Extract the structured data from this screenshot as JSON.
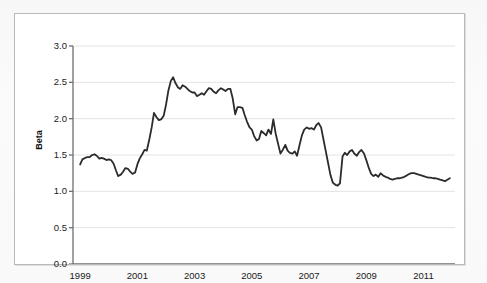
{
  "figure": {
    "background_color": "#ffffff",
    "frame_color": "#b9b9b9",
    "page_background": "#f8f8f8"
  },
  "chart_data": {
    "type": "line",
    "title": "",
    "subtitle": "",
    "xlabel": "",
    "ylabel": "Beta",
    "xlim": [
      1998.75,
      2012.1
    ],
    "ylim": [
      0.0,
      3.0
    ],
    "grid": true,
    "grid_axis": "y",
    "grid_color": "#e3e3e3",
    "legend": null,
    "legend_position": "none",
    "line_color": "#2b2b2b",
    "line_width": 1.8,
    "axis_color": "#6e6e6e",
    "yticks": [
      0.0,
      0.5,
      1.0,
      1.5,
      2.0,
      2.5,
      3.0
    ],
    "ytick_labels": [
      "0.0",
      "0.5",
      "1.0",
      "1.5",
      "2.0",
      "2.5",
      "3.0"
    ],
    "xticks_major": [
      1999,
      2001,
      2003,
      2005,
      2007,
      2009,
      2011
    ],
    "xtick_labels": [
      "1999",
      "2001",
      "2003",
      "2005",
      "2007",
      "2009",
      "2011"
    ],
    "xticks_minor": [
      2000,
      2002,
      2004,
      2006,
      2008,
      2010,
      2012
    ],
    "series": [
      {
        "name": "Beta",
        "x": [
          1999.0,
          1999.08,
          1999.17,
          1999.25,
          1999.33,
          1999.42,
          1999.5,
          1999.58,
          1999.67,
          1999.75,
          1999.83,
          1999.92,
          2000.0,
          2000.08,
          2000.17,
          2000.25,
          2000.33,
          2000.42,
          2000.5,
          2000.58,
          2000.67,
          2000.75,
          2000.83,
          2000.92,
          2001.0,
          2001.08,
          2001.17,
          2001.25,
          2001.33,
          2001.42,
          2001.5,
          2001.58,
          2001.67,
          2001.75,
          2001.83,
          2001.92,
          2002.0,
          2002.08,
          2002.17,
          2002.25,
          2002.33,
          2002.42,
          2002.5,
          2002.58,
          2002.67,
          2002.75,
          2002.83,
          2002.92,
          2003.0,
          2003.08,
          2003.17,
          2003.25,
          2003.33,
          2003.42,
          2003.5,
          2003.58,
          2003.67,
          2003.75,
          2003.83,
          2003.92,
          2004.0,
          2004.08,
          2004.17,
          2004.25,
          2004.33,
          2004.42,
          2004.5,
          2004.58,
          2004.67,
          2004.75,
          2004.83,
          2004.92,
          2005.0,
          2005.08,
          2005.17,
          2005.25,
          2005.33,
          2005.42,
          2005.5,
          2005.58,
          2005.67,
          2005.75,
          2005.83,
          2005.92,
          2006.0,
          2006.08,
          2006.17,
          2006.25,
          2006.33,
          2006.42,
          2006.5,
          2006.58,
          2006.67,
          2006.75,
          2006.83,
          2006.92,
          2007.0,
          2007.08,
          2007.17,
          2007.25,
          2007.33,
          2007.42,
          2007.5,
          2007.58,
          2007.67,
          2007.75,
          2007.83,
          2007.92,
          2008.0,
          2008.08,
          2008.17,
          2008.25,
          2008.33,
          2008.42,
          2008.5,
          2008.58,
          2008.67,
          2008.75,
          2008.83,
          2008.92,
          2009.0,
          2009.08,
          2009.17,
          2009.25,
          2009.33,
          2009.42,
          2009.5,
          2009.58,
          2009.67,
          2009.75,
          2009.83,
          2009.92,
          2010.0,
          2010.08,
          2010.17,
          2010.25,
          2010.33,
          2010.42,
          2010.5,
          2010.58,
          2010.67,
          2010.75,
          2010.83,
          2010.92,
          2011.0,
          2011.08,
          2011.17,
          2011.25,
          2011.33,
          2011.42,
          2011.5,
          2011.58,
          2011.67,
          2011.75,
          2011.83,
          2011.92
        ],
        "values": [
          1.37,
          1.44,
          1.46,
          1.47,
          1.47,
          1.5,
          1.51,
          1.49,
          1.45,
          1.46,
          1.45,
          1.43,
          1.44,
          1.43,
          1.38,
          1.29,
          1.21,
          1.23,
          1.27,
          1.32,
          1.31,
          1.27,
          1.24,
          1.26,
          1.37,
          1.45,
          1.51,
          1.57,
          1.56,
          1.72,
          1.88,
          2.08,
          2.02,
          1.98,
          1.99,
          2.04,
          2.19,
          2.38,
          2.52,
          2.57,
          2.49,
          2.43,
          2.41,
          2.46,
          2.44,
          2.41,
          2.38,
          2.36,
          2.36,
          2.31,
          2.33,
          2.35,
          2.33,
          2.38,
          2.42,
          2.41,
          2.37,
          2.35,
          2.39,
          2.42,
          2.4,
          2.38,
          2.41,
          2.41,
          2.28,
          2.06,
          2.16,
          2.16,
          2.15,
          2.05,
          1.96,
          1.88,
          1.85,
          1.76,
          1.7,
          1.72,
          1.83,
          1.8,
          1.77,
          1.85,
          1.79,
          1.99,
          1.8,
          1.65,
          1.52,
          1.57,
          1.64,
          1.56,
          1.53,
          1.52,
          1.55,
          1.49,
          1.64,
          1.77,
          1.85,
          1.88,
          1.86,
          1.87,
          1.85,
          1.91,
          1.94,
          1.88,
          1.72,
          1.56,
          1.38,
          1.22,
          1.12,
          1.09,
          1.08,
          1.11,
          1.48,
          1.53,
          1.5,
          1.55,
          1.57,
          1.52,
          1.49,
          1.54,
          1.57,
          1.52,
          1.43,
          1.33,
          1.24,
          1.21,
          1.23,
          1.2,
          1.25,
          1.22,
          1.2,
          1.19,
          1.17,
          1.16,
          1.17,
          1.18,
          1.18,
          1.19,
          1.2,
          1.22,
          1.24,
          1.25,
          1.25,
          1.24,
          1.23,
          1.22,
          1.21,
          1.2,
          1.19,
          1.19,
          1.18,
          1.18,
          1.17,
          1.16,
          1.15,
          1.14,
          1.16,
          1.18
        ]
      }
    ]
  }
}
